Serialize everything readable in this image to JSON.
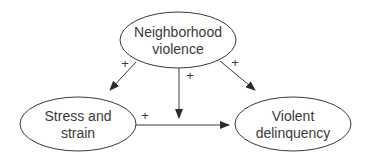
{
  "diagram": {
    "type": "causal-path-model",
    "colors": {
      "stroke": "#3a3a3a",
      "background": "#ffffff",
      "text": "#3a3a3a"
    },
    "nodes": [
      {
        "id": "neighborhood-violence",
        "lines": [
          "Neighborhood",
          "violence"
        ],
        "cx": 178,
        "cy": 40,
        "rx": 58,
        "ry": 28
      },
      {
        "id": "stress-and-strain",
        "lines": [
          "Stress and",
          "strain"
        ],
        "cx": 78,
        "cy": 124,
        "rx": 58,
        "ry": 27
      },
      {
        "id": "violent-delinquency",
        "lines": [
          "Violent",
          "delinquency"
        ],
        "cx": 293,
        "cy": 124,
        "rx": 58,
        "ry": 27
      }
    ],
    "edges": [
      {
        "from": "neighborhood-violence",
        "to": "stress-and-strain",
        "sign": "+"
      },
      {
        "from": "neighborhood-violence",
        "to": "stress-and-strain->violent-delinquency",
        "sign": "+",
        "note": "moderating effect on path"
      },
      {
        "from": "neighborhood-violence",
        "to": "violent-delinquency",
        "sign": "+"
      },
      {
        "from": "stress-and-strain",
        "to": "violent-delinquency",
        "sign": "+"
      }
    ]
  }
}
